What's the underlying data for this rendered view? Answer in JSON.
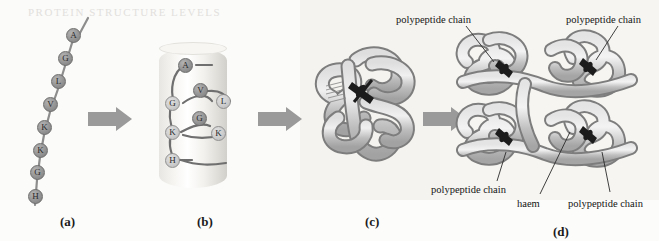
{
  "figure": {
    "title_ghost": "PROTEIN STRUCTURE LEVELS",
    "background_color": "#fdfdfb",
    "arrow_color": "#9a9a9a",
    "chain_color": "#a9a9a9",
    "haem_color": "#1c1c1c"
  },
  "panels": [
    {
      "id": "a",
      "label": "(a)",
      "label_x": 60,
      "label_y": 214,
      "name": "primary-structure",
      "residues": [
        {
          "letter": "A",
          "x": 73,
          "y": 35,
          "shade": "dark"
        },
        {
          "letter": "G",
          "x": 65,
          "y": 58,
          "shade": "dark"
        },
        {
          "letter": "L",
          "x": 58,
          "y": 81,
          "shade": "dark"
        },
        {
          "letter": "V",
          "x": 50,
          "y": 104,
          "shade": "dark"
        },
        {
          "letter": "K",
          "x": 44,
          "y": 127,
          "shade": "dark"
        },
        {
          "letter": "K",
          "x": 40,
          "y": 150,
          "shade": "dark"
        },
        {
          "letter": "G",
          "x": 37,
          "y": 172,
          "shade": "dark"
        },
        {
          "letter": "H",
          "x": 35,
          "y": 196,
          "shade": "dark"
        }
      ]
    },
    {
      "id": "b",
      "label": "(b)",
      "label_x": 197,
      "label_y": 214,
      "name": "secondary-structure",
      "residues": [
        {
          "letter": "A",
          "x": 185,
          "y": 65,
          "shade": "dark"
        },
        {
          "letter": "V",
          "x": 200,
          "y": 90,
          "shade": "dark"
        },
        {
          "letter": "L",
          "x": 223,
          "y": 101,
          "shade": "light"
        },
        {
          "letter": "G",
          "x": 172,
          "y": 103,
          "shade": "light"
        },
        {
          "letter": "G",
          "x": 199,
          "y": 118,
          "shade": "dark"
        },
        {
          "letter": "K",
          "x": 172,
          "y": 132,
          "shade": "light"
        },
        {
          "letter": "K",
          "x": 218,
          "y": 133,
          "shade": "light"
        },
        {
          "letter": "H",
          "x": 172,
          "y": 160,
          "shade": "light"
        }
      ]
    },
    {
      "id": "c",
      "label": "(c)",
      "label_x": 365,
      "label_y": 214,
      "name": "tertiary-structure"
    },
    {
      "id": "d",
      "label": "(d)",
      "label_x": 553,
      "label_y": 224,
      "name": "quaternary-structure"
    }
  ],
  "arrows": [
    {
      "name": "arrow-a-to-b",
      "x": 88,
      "y": 107,
      "width": 44,
      "height": 24
    },
    {
      "name": "arrow-b-to-c",
      "x": 258,
      "y": 107,
      "width": 44,
      "height": 24
    },
    {
      "name": "arrow-c-to-d",
      "x": 423,
      "y": 107,
      "width": 44,
      "height": 24
    }
  ],
  "callouts": [
    {
      "name": "callout-polypeptide-chain-top-left",
      "text": "polypeptide chain",
      "text_x": 396,
      "text_y": 14,
      "line": {
        "x1": 466,
        "y1": 26,
        "x2": 494,
        "y2": 62
      }
    },
    {
      "name": "callout-polypeptide-chain-top-right",
      "text": "polypeptide chain",
      "text_x": 566,
      "text_y": 14,
      "line": {
        "x1": 618,
        "y1": 26,
        "x2": 596,
        "y2": 60
      }
    },
    {
      "name": "callout-polypeptide-chain-bottom-left",
      "text": "polypeptide chain",
      "text_x": 431,
      "text_y": 184,
      "line": {
        "x1": 497,
        "y1": 181,
        "x2": 506,
        "y2": 152
      }
    },
    {
      "name": "callout-haem",
      "text": "haem",
      "text_x": 517,
      "text_y": 198,
      "line": {
        "x1": 540,
        "y1": 194,
        "x2": 570,
        "y2": 132
      }
    },
    {
      "name": "callout-polypeptide-chain-bottom-right",
      "text": "polypeptide chain",
      "text_x": 568,
      "text_y": 198,
      "line": {
        "x1": 610,
        "y1": 192,
        "x2": 602,
        "y2": 152
      }
    }
  ]
}
